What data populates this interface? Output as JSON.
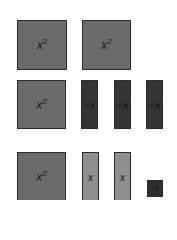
{
  "diagram": {
    "type": "algebra-tiles",
    "colors": {
      "x_squared": "#6b6b6b",
      "neg_x": "#353535",
      "pos_x": "#8f8f8f",
      "neg_one": "#2f2f2f",
      "border": "#2a2a2a",
      "background": "#ffffff"
    },
    "rows": [
      {
        "tiles": [
          {
            "kind": "x_squared",
            "base": "x",
            "exp": "2"
          },
          {
            "kind": "x_squared",
            "base": "x",
            "exp": "2"
          }
        ]
      },
      {
        "tiles": [
          {
            "kind": "x_squared",
            "base": "x",
            "exp": "2"
          },
          {
            "kind": "neg_x",
            "label": "−x"
          },
          {
            "kind": "neg_x",
            "label": "−x"
          },
          {
            "kind": "neg_x",
            "label": "−x"
          }
        ]
      },
      {
        "tiles": [
          {
            "kind": "x_squared",
            "base": "x",
            "exp": "2"
          },
          {
            "kind": "pos_x",
            "label": "x"
          },
          {
            "kind": "pos_x",
            "label": "x"
          },
          {
            "kind": "neg_one",
            "label": "−1"
          }
        ]
      }
    ]
  }
}
